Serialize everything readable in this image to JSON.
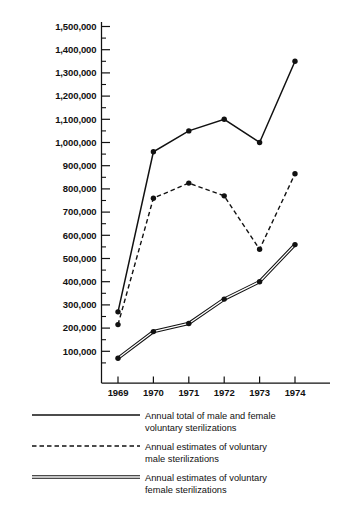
{
  "chart_data": {
    "type": "line",
    "title": "",
    "subtitle": "",
    "xlabel": "",
    "ylabel": "",
    "categories": [
      "1969",
      "1970",
      "1971",
      "1972",
      "1973",
      "1974"
    ],
    "x": [
      1969,
      1970,
      1971,
      1972,
      1973,
      1974
    ],
    "ylim": [
      0,
      1500000
    ],
    "ytick_values": [
      100000,
      200000,
      300000,
      400000,
      500000,
      600000,
      700000,
      800000,
      900000,
      1000000,
      1100000,
      1200000,
      1300000,
      1400000,
      1500000
    ],
    "ytick_labels": [
      "100,000",
      "200,000",
      "300,000",
      "400,000",
      "500,000",
      "600,000",
      "700,000",
      "800,000",
      "900,000",
      "1,000,000",
      "1,100,000",
      "1,200,000",
      "1,300,000",
      "1,400,000",
      "1,500,000"
    ],
    "minor_tick_interval": 50000,
    "grid": false,
    "legend_position": "bottom",
    "series": [
      {
        "name": "Annual total of male and female voluntary sterilizations",
        "style": "solid",
        "marker": "filled-circle",
        "values": [
          270000,
          960000,
          1050000,
          1100000,
          1000000,
          1350000
        ]
      },
      {
        "name": "Annual estimates of voluntary male sterilizations",
        "style": "dashed",
        "marker": "filled-circle",
        "values": [
          215000,
          760000,
          825000,
          770000,
          540000,
          865000
        ]
      },
      {
        "name": "Annual estimates of voluntary female sterilizations",
        "style": "double",
        "marker": "filled-circle",
        "values": [
          70000,
          185000,
          220000,
          325000,
          400000,
          560000
        ]
      }
    ]
  },
  "legend": {
    "items": [
      {
        "line1": "Annual total of male and female",
        "line2": "voluntary sterilizations",
        "style": "solid"
      },
      {
        "line1": "Annual estimates of voluntary",
        "line2": "male sterilizations",
        "style": "dashed"
      },
      {
        "line1": "Annual estimates of voluntary",
        "line2": "female sterilizations",
        "style": "double"
      }
    ]
  },
  "colors": {
    "ink": "#111111",
    "paper": "#ffffff"
  }
}
